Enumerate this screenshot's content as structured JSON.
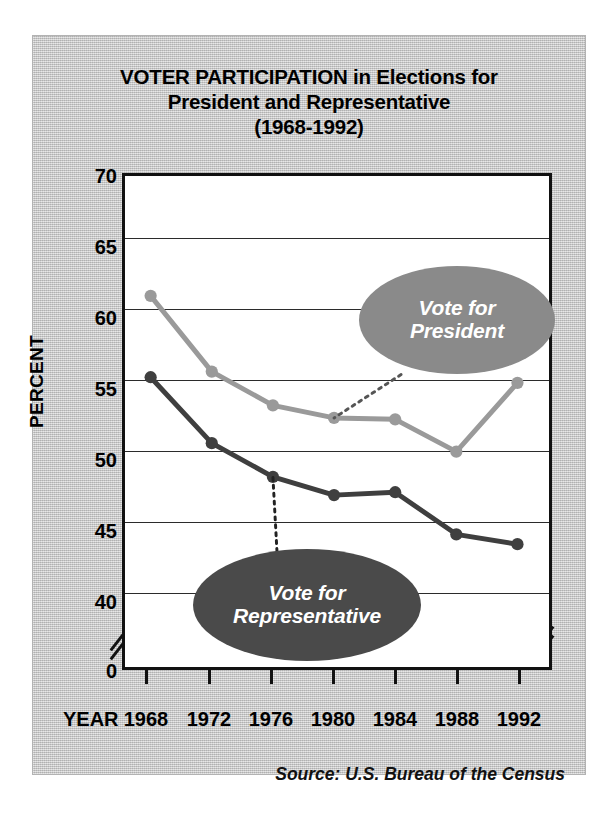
{
  "title": {
    "line1": "VOTER PARTICIPATION in Elections for",
    "line2": "President and Representative",
    "line3": "(1968-1992)"
  },
  "axes": {
    "y_title": "PERCENT",
    "x_title": "YEAR",
    "y_ticks": [
      "70",
      "65",
      "60",
      "55",
      "50",
      "45",
      "40",
      "0"
    ],
    "x_ticks": [
      "1968",
      "1972",
      "1976",
      "1980",
      "1984",
      "1988",
      "1992"
    ]
  },
  "callouts": {
    "president": {
      "line1": "Vote for",
      "line2": "President",
      "color": "#8a8a8a"
    },
    "representative": {
      "line1": "Vote for",
      "line2": "Representative",
      "color": "#4a4a4a"
    }
  },
  "source": "Source: U.S. Bureau of the Census",
  "chart_data": {
    "type": "line",
    "title": "VOTER PARTICIPATION in Elections for President and Representative (1968-1992)",
    "xlabel": "YEAR",
    "ylabel": "PERCENT",
    "x": [
      1968,
      1972,
      1976,
      1980,
      1984,
      1988,
      1992
    ],
    "ylim": [
      40,
      70
    ],
    "ytick_values": [
      40,
      45,
      50,
      55,
      60,
      65,
      70
    ],
    "y_axis_break": true,
    "y_axis_break_label": "0",
    "grid": true,
    "legend": "inline-callouts",
    "series": [
      {
        "name": "Vote for President",
        "color": "#9a9a9a",
        "values": [
          60.8,
          55.4,
          53.0,
          52.1,
          52.0,
          49.7,
          54.6
        ]
      },
      {
        "name": "Vote for Representative",
        "color": "#3f3f3f",
        "values": [
          55.0,
          50.3,
          47.9,
          46.6,
          46.8,
          43.8,
          43.1
        ]
      }
    ]
  }
}
